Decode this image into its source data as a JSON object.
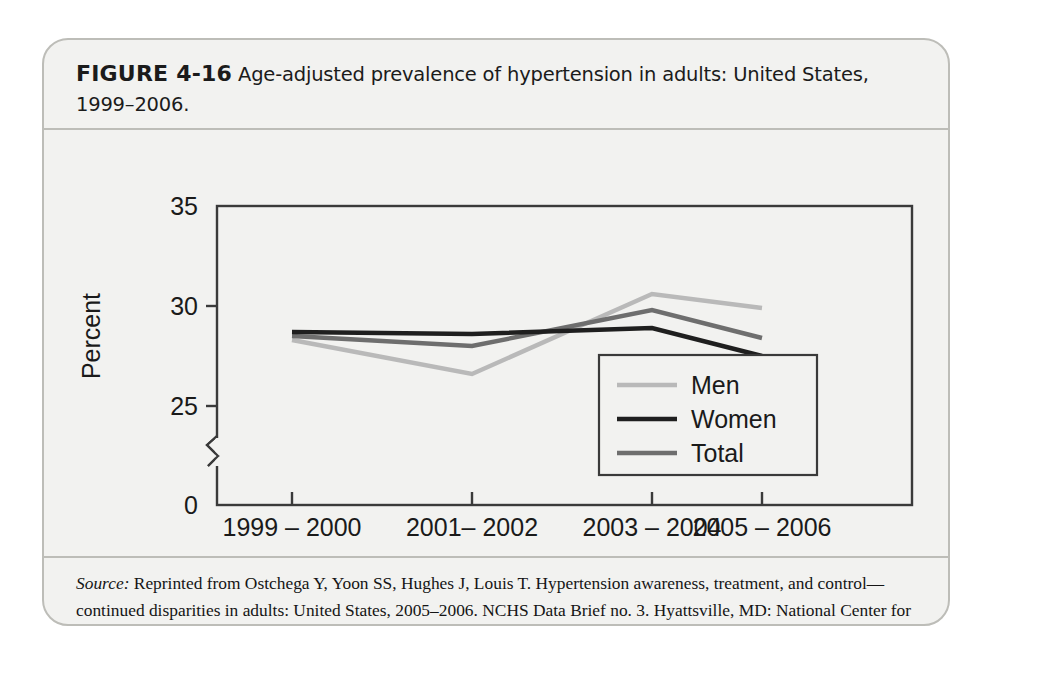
{
  "figure": {
    "label": "FIGURE 4-16",
    "caption": "Age-adjusted prevalence of hypertension in adults: United States, 1999–2006."
  },
  "source": {
    "label": "Source:",
    "text": " Reprinted from Ostchega Y, Yoon SS, Hughes J, Louis T. Hypertension awareness, treatment, and control—continued disparities in adults: United States, 2005–2006. NCHS Data Brief no. 3. Hyattsville, MD: National Center for Health Statistics; 2008:1."
  },
  "colors": {
    "men": "#b9b9b9",
    "women": "#1f1f1f",
    "total": "#6e6e6e",
    "axis": "#3a3a3a",
    "plot_bg": "#f2f2f0",
    "card_border": "#bdbdb8"
  },
  "chart_data": {
    "type": "line",
    "title": "",
    "xlabel": "",
    "ylabel": "Percent",
    "categories": [
      "1999 – 2000",
      "2001– 2002",
      "2003 – 2004",
      "2005 – 2006"
    ],
    "yticks": [
      0,
      25,
      30,
      35
    ],
    "ytick_labels": [
      "0",
      "25",
      "30",
      "35"
    ],
    "ylim": [
      0,
      35
    ],
    "y_axis_break": true,
    "y_axis_break_between": [
      0,
      25
    ],
    "grid": false,
    "legend_position": "lower right",
    "series": [
      {
        "name": "Men",
        "values": [
          28.3,
          26.6,
          30.6,
          29.9
        ]
      },
      {
        "name": "Women",
        "values": [
          28.7,
          28.6,
          28.9,
          27.5
        ]
      },
      {
        "name": "Total",
        "values": [
          28.5,
          28.0,
          29.8,
          28.4
        ]
      }
    ]
  }
}
